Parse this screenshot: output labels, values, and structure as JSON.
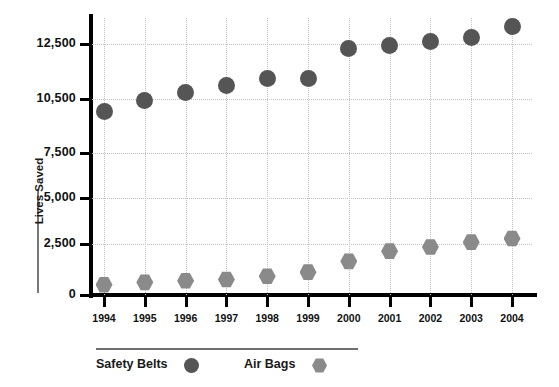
{
  "chart_data": {
    "type": "scatter",
    "title": "",
    "xlabel": "",
    "ylabel": "Lives Saved",
    "categories": [
      "1994",
      "1995",
      "1996",
      "1997",
      "1998",
      "1999",
      "2000",
      "2001",
      "2002",
      "2003",
      "2004"
    ],
    "ytick_labels": [
      "0",
      "2,500",
      "5,000",
      "7,500",
      "10,500",
      "12,500"
    ],
    "ytick_values": [
      0,
      2500,
      5000,
      7500,
      10500,
      12500
    ],
    "ylim": [
      0,
      13500
    ],
    "grid": "dotted-both",
    "legend_position": "bottom-left",
    "series": [
      {
        "name": "Safety Belts",
        "marker": "circle",
        "color": "#555555",
        "values": [
          9800,
          10400,
          10750,
          11000,
          11250,
          11250,
          12350,
          12450,
          12600,
          12750,
          13150
        ]
      },
      {
        "name": "Air Bags",
        "marker": "hexagon",
        "color": "#8a8a8a",
        "values": [
          500,
          620,
          700,
          760,
          920,
          1120,
          1650,
          2150,
          2350,
          2600,
          2800
        ]
      }
    ]
  },
  "legend": {
    "items": [
      {
        "label": "Safety Belts",
        "marker": "circle",
        "color": "#555555"
      },
      {
        "label": "Air Bags",
        "marker": "hexagon",
        "color": "#8a8a8a"
      }
    ]
  },
  "axes": {
    "y_title": "Lives Saved"
  },
  "clipped_header": ""
}
